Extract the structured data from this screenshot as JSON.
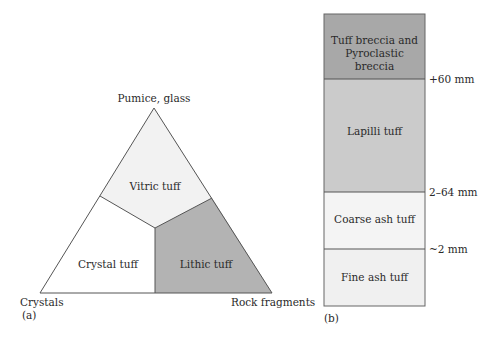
{
  "panel_a": {
    "caption": "(a)",
    "apex_labels": {
      "top": "Pumice, glass",
      "bottom_left": "Crystals",
      "bottom_right": "Rock fragments"
    },
    "fields": [
      {
        "name": "Vitric tuff",
        "fill": "#f2f2f2"
      },
      {
        "name": "Crystal tuff",
        "fill": "#ffffff"
      },
      {
        "name": "Lithic tuff",
        "fill": "#b3b3b3"
      }
    ]
  },
  "panel_b": {
    "caption": "(b)",
    "layers": [
      {
        "name_line1": "Tuff breccia and",
        "name_line2": "Pyroclastic breccia",
        "fill": "#a8a8a8"
      },
      {
        "name": "Lapilli tuff",
        "fill": "#cbcbcb"
      },
      {
        "name": "Coarse ash tuff",
        "fill": "#f4f4f4"
      },
      {
        "name": "Fine ash tuff",
        "fill": "#f0f0f0"
      }
    ],
    "boundaries": [
      "+60 mm",
      "2–64 mm",
      "~2 mm"
    ]
  },
  "colors": {
    "stroke": "#555555",
    "text": "#2a2a2a"
  }
}
